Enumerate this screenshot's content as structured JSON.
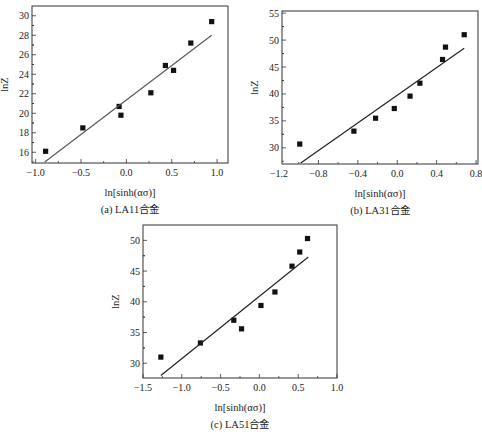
{
  "chart_data": [
    {
      "id": "a",
      "type": "scatter",
      "title": "",
      "caption": "(a) LA11合金",
      "xlabel": "ln[sinh(ασ)]",
      "ylabel": "lnZ",
      "xlim": [
        -1.04,
        1.12
      ],
      "ylim": [
        14.9,
        31.0
      ],
      "xticks": [
        -1.0,
        -0.5,
        0.0,
        0.5,
        1.0
      ],
      "xtick_labels": [
        "−1.0",
        "−0.5",
        "0.0",
        "0.5",
        "1.0"
      ],
      "yticks": [
        16,
        18,
        20,
        22,
        24,
        26,
        28,
        30
      ],
      "ytick_labels": [
        "16",
        "18",
        "20",
        "22",
        "24",
        "26",
        "28",
        "30"
      ],
      "grid": false,
      "series": [
        {
          "name": "data",
          "marker": "square",
          "x": [
            -0.89,
            -0.48,
            -0.08,
            -0.06,
            0.27,
            0.43,
            0.52,
            0.71,
            0.94
          ],
          "y": [
            16.1,
            18.5,
            20.7,
            19.8,
            22.1,
            24.9,
            24.4,
            27.2,
            29.4
          ]
        },
        {
          "name": "linear fit",
          "line": true,
          "x": [
            -0.9,
            0.94
          ],
          "y": [
            15.0,
            28.0
          ]
        }
      ],
      "frame": {
        "left": 32,
        "top": 6,
        "right": 228,
        "bottom": 163
      }
    },
    {
      "id": "b",
      "type": "scatter",
      "title": "",
      "caption": "(b) LA31合金",
      "xlabel": "ln[sinh(ασ)]",
      "ylabel": "lnZ",
      "xlim": [
        -1.17,
        0.82
      ],
      "ylim": [
        27.0,
        55.4
      ],
      "xticks": [
        -1.2,
        -0.8,
        -0.4,
        0.0,
        0.4,
        0.8
      ],
      "xtick_labels": [
        "−1.2",
        "−0.8",
        "−0.4",
        "0.0",
        "0.4",
        "0.8"
      ],
      "yticks": [
        30,
        35,
        40,
        45,
        50,
        55
      ],
      "ytick_labels": [
        "30",
        "35",
        "40",
        "45",
        "50",
        "55"
      ],
      "grid": false,
      "series": [
        {
          "name": "data",
          "marker": "square",
          "x": [
            -0.99,
            -0.44,
            -0.22,
            -0.03,
            0.13,
            0.23,
            0.46,
            0.49,
            0.68
          ],
          "y": [
            30.7,
            33.1,
            35.5,
            37.3,
            39.6,
            42.0,
            46.4,
            48.7,
            51.0
          ]
        },
        {
          "name": "linear fit",
          "line": true,
          "x": [
            -0.98,
            0.68
          ],
          "y": [
            27.2,
            48.5
          ]
        }
      ],
      "frame": {
        "left": 282,
        "top": 11,
        "right": 478,
        "bottom": 164
      }
    },
    {
      "id": "c",
      "type": "scatter",
      "title": "",
      "caption": "(c) LA51合金",
      "xlabel": "ln[sinh(ασ)]",
      "ylabel": "lnZ",
      "xlim": [
        -1.5,
        1.0
      ],
      "ylim": [
        27.6,
        52.5
      ],
      "xticks": [
        -1.5,
        -1.0,
        -0.5,
        0.0,
        0.5,
        1.0
      ],
      "xtick_labels": [
        "−1.5",
        "−1.0",
        "−0.5",
        "0.0",
        "0.5",
        "1.0"
      ],
      "yticks": [
        30,
        35,
        40,
        45,
        50
      ],
      "ytick_labels": [
        "30",
        "35",
        "40",
        "45",
        "50"
      ],
      "grid": false,
      "series": [
        {
          "name": "data",
          "marker": "square",
          "x": [
            -1.27,
            -0.76,
            -0.33,
            -0.23,
            0.02,
            0.2,
            0.42,
            0.52,
            0.62
          ],
          "y": [
            31.0,
            33.3,
            37.0,
            35.6,
            39.4,
            41.6,
            45.8,
            48.1,
            50.3
          ]
        },
        {
          "name": "linear fit",
          "line": true,
          "x": [
            -1.27,
            0.63
          ],
          "y": [
            28.0,
            47.3
          ]
        }
      ],
      "frame": {
        "left": 143,
        "top": 225,
        "right": 337,
        "bottom": 378
      }
    }
  ]
}
